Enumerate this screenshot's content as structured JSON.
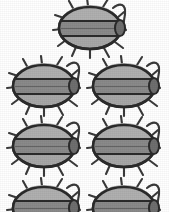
{
  "image": {
    "title": "Beetle specimen illustration grid",
    "subject": "beetle",
    "style": "grayscale engraved line drawing",
    "background_color": "#ffffff",
    "width": 169,
    "height": 212,
    "count_visible": 7
  },
  "palette": {
    "outline": "#2b2b2b",
    "elytra_band": "#8a8a8a",
    "pronotum": "#b0b0b0",
    "abdomen": "#a3a3a3",
    "leg": "#3a3a3a",
    "antenna": "#3a3a3a",
    "paper": "#ffffff"
  },
  "layout": {
    "rows": [
      {
        "row_label": "row-1",
        "top": -4,
        "items": [
          {
            "left": 52
          }
        ]
      },
      {
        "row_label": "row-2",
        "top": 54,
        "items": [
          {
            "left": 6
          },
          {
            "left": 86
          }
        ]
      },
      {
        "row_label": "row-3",
        "top": 114,
        "items": [
          {
            "left": 6
          },
          {
            "left": 86
          }
        ]
      },
      {
        "row_label": "row-4",
        "top": 176,
        "items": [
          {
            "left": 6
          },
          {
            "left": 86
          }
        ]
      }
    ]
  },
  "beetles": [
    {
      "id": "beetle-1",
      "row": 1,
      "column": 1,
      "left": 52,
      "top": -4,
      "clipped": false
    },
    {
      "id": "beetle-2",
      "row": 2,
      "column": 1,
      "left": 6,
      "top": 54,
      "clipped": false
    },
    {
      "id": "beetle-3",
      "row": 2,
      "column": 2,
      "left": 86,
      "top": 54,
      "clipped": false
    },
    {
      "id": "beetle-4",
      "row": 3,
      "column": 1,
      "left": 6,
      "top": 114,
      "clipped": false
    },
    {
      "id": "beetle-5",
      "row": 3,
      "column": 2,
      "left": 86,
      "top": 114,
      "clipped": false
    },
    {
      "id": "beetle-6",
      "row": 4,
      "column": 1,
      "left": 6,
      "top": 176,
      "clipped": true
    },
    {
      "id": "beetle-7",
      "row": 4,
      "column": 2,
      "left": 86,
      "top": 176,
      "clipped": true
    }
  ],
  "anatomy": {
    "parts": [
      "pronotum",
      "elytra",
      "elytral-suture",
      "abdomen",
      "legs",
      "antenna"
    ],
    "leg_count_per_side": 3,
    "antenna_side": "right"
  }
}
